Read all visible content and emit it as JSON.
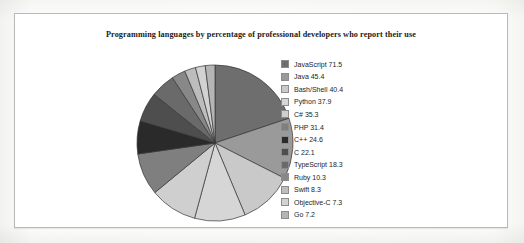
{
  "chart_data": {
    "type": "pie",
    "title": "Programming languages by percentage of professional developers who report their use",
    "xlabel": "",
    "ylabel": "",
    "legend_position": "right",
    "grid": false,
    "start_angle_deg": 0,
    "direction": "clockwise",
    "value_unit": "percent",
    "categories": [
      "JavaScript",
      "Java",
      "Bash/Shell",
      "Python",
      "C#",
      "PHP",
      "C++",
      "C",
      "TypeScript",
      "Ruby",
      "Swift",
      "Objective-C",
      "Go"
    ],
    "values": [
      71.5,
      45.4,
      40.4,
      37.9,
      35.3,
      31.4,
      24.6,
      22.1,
      18.3,
      10.3,
      8.3,
      7.3,
      7.2
    ],
    "colors": [
      "#6e6e6e",
      "#9a9a9a",
      "#c9c9c9",
      "#d6d6d6",
      "#cfcfcf",
      "#7f7f7f",
      "#2a2a2a",
      "#4e4e4e",
      "#6a6a6a",
      "#888888",
      "#bdbdbd",
      "#d2d2d2",
      "#b5b5b5"
    ],
    "legend_entries": [
      "JavaScript 71.5",
      "Java 45.4",
      "Bash/Shell 40.4",
      "Python 37.9",
      "C# 35.3",
      "PHP 31.4",
      "C++ 24.6",
      "C 22.1",
      "TypeScript 18.3",
      "Ruby 10.3",
      "Swift 8.3",
      "Objective-C 7.3",
      "Go 7.2"
    ]
  }
}
